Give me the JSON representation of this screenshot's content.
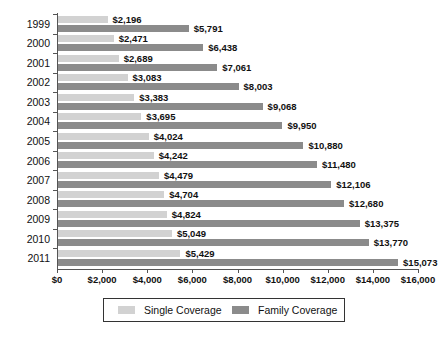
{
  "chart_data": {
    "type": "bar",
    "orientation": "horizontal",
    "title": "",
    "xlabel": "",
    "ylabel": "",
    "xlim": [
      0,
      16000
    ],
    "grid": false,
    "legend_position": "bottom",
    "categories": [
      "1999",
      "2000",
      "2001",
      "2002",
      "2003",
      "2004",
      "2005",
      "2006",
      "2007",
      "2008",
      "2009",
      "2010",
      "2011"
    ],
    "xticks": [
      0,
      2000,
      4000,
      6000,
      8000,
      10000,
      12000,
      14000,
      16000
    ],
    "xtick_labels": [
      "$0",
      "$2,000",
      "$4,000",
      "$6,000",
      "$8,000",
      "$10,000",
      "$12,000",
      "$14,000",
      "$16,000"
    ],
    "series": [
      {
        "name": "Single Coverage",
        "color": "#d2d2d2",
        "values": [
          2196,
          2471,
          2689,
          3083,
          3383,
          3695,
          4024,
          4242,
          4479,
          4704,
          4824,
          5049,
          5429
        ],
        "labels": [
          "$2,196",
          "$2,471",
          "$2,689",
          "$3,083",
          "$3,383",
          "$3,695",
          "$4,024",
          "$4,242",
          "$4,479",
          "$4,704",
          "$4,824",
          "$5,049",
          "$5,429"
        ]
      },
      {
        "name": "Family Coverage",
        "color": "#8b8b8b",
        "values": [
          5791,
          6438,
          7061,
          8003,
          9068,
          9950,
          10880,
          11480,
          12106,
          12680,
          13375,
          13770,
          15073
        ],
        "labels": [
          "$5,791",
          "$6,438",
          "$7,061",
          "$8,003",
          "$9,068",
          "$9,950",
          "$10,880",
          "$11,480",
          "$12,106",
          "$12,680",
          "$13,375",
          "$13,770",
          "$15,073"
        ]
      }
    ]
  },
  "legend": {
    "items": [
      {
        "label": "Single Coverage"
      },
      {
        "label": "Family Coverage"
      }
    ]
  }
}
